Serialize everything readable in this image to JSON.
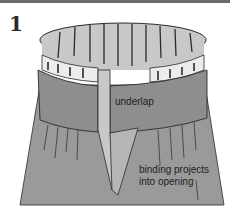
{
  "figure": {
    "step_number": "1",
    "labels": {
      "underlap": "underlap",
      "binding_line1": "binding projects",
      "binding_line2": "into opening"
    },
    "colors": {
      "fabric": "#9a9a9a",
      "fabric_dark": "#8a8a8a",
      "binding": "#e8e8e8",
      "inside": "#c8c8c8",
      "outline": "#2a2a2a",
      "top_bar": "#6a6a6a"
    }
  }
}
